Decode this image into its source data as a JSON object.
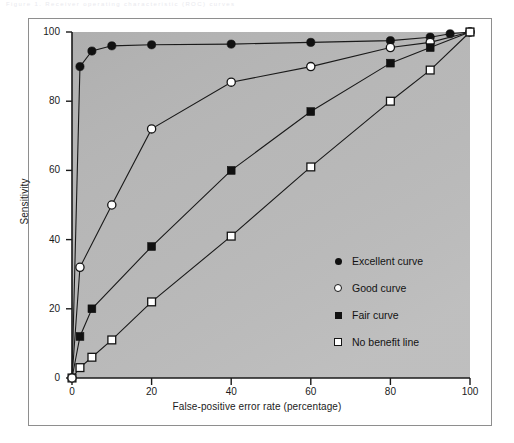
{
  "figure": {
    "faint_top_caption": "Figure 1.  Receiver operating characteristic (ROC) curves",
    "background_color": "#ffffff",
    "plot_area_color": "#b6b6b6",
    "frame_color": "#8e8e8e",
    "line_color": "#1a1a1a"
  },
  "chart_data": {
    "type": "line",
    "title": "",
    "xlabel": "False-positive error rate (percentage)",
    "ylabel": "Sensitivity",
    "xlim": [
      0,
      100
    ],
    "ylim": [
      0,
      100
    ],
    "xticks": [
      "0",
      "20",
      "40",
      "60",
      "80",
      "100"
    ],
    "yticks": [
      "0",
      "20",
      "40",
      "60",
      "80",
      "100"
    ],
    "xtick_values": [
      0,
      20,
      40,
      60,
      80,
      100
    ],
    "ytick_values": [
      0,
      20,
      40,
      60,
      80,
      100
    ],
    "grid": false,
    "legend_position": "center-right-inside",
    "series": [
      {
        "name": "Excellent curve",
        "marker": "filled-circle",
        "x": [
          0,
          2,
          5,
          10,
          20,
          40,
          60,
          80,
          90,
          95,
          100
        ],
        "y": [
          0,
          90,
          94.5,
          96,
          96.3,
          96.5,
          97,
          97.5,
          98.5,
          99.5,
          100
        ]
      },
      {
        "name": "Good curve",
        "marker": "open-circle",
        "x": [
          0,
          2,
          10,
          20,
          40,
          60,
          80,
          90,
          100
        ],
        "y": [
          0,
          32,
          50,
          72,
          85.5,
          90,
          95.5,
          97,
          100
        ]
      },
      {
        "name": "Fair curve",
        "marker": "filled-square",
        "x": [
          0,
          2,
          5,
          20,
          40,
          60,
          80,
          90,
          100
        ],
        "y": [
          0,
          12,
          20,
          38,
          60,
          77,
          91,
          95.5,
          100
        ]
      },
      {
        "name": "No benefit line",
        "marker": "open-square",
        "x": [
          0,
          2,
          5,
          10,
          20,
          40,
          60,
          80,
          90,
          100
        ],
        "y": [
          0,
          3,
          6,
          11,
          22,
          41,
          61,
          80,
          89,
          100
        ]
      }
    ]
  },
  "legend": {
    "items": [
      {
        "marker": "filled-circle",
        "label": "Excellent curve"
      },
      {
        "marker": "open-circle",
        "label": "Good curve"
      },
      {
        "marker": "filled-square",
        "label": "Fair curve"
      },
      {
        "marker": "open-square",
        "label": "No benefit line"
      }
    ]
  }
}
